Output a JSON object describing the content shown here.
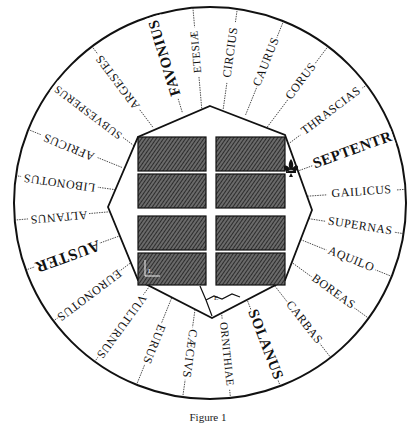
{
  "figure": {
    "caption": "Figure 1",
    "colors": {
      "ink": "#111111",
      "paper": "#ffffff",
      "hatch": "#3a3a3a"
    }
  },
  "center": {
    "x": 210,
    "y": 203,
    "r": 196
  },
  "winds": [
    {
      "label": "FAVONIUS",
      "angle": 107,
      "size": 15,
      "major": true
    },
    {
      "label": "ETESIÆ",
      "angle": 95,
      "size": 11,
      "major": false
    },
    {
      "label": "CIRCIUS",
      "angle": 82,
      "size": 12,
      "major": false
    },
    {
      "label": "CAURUS",
      "angle": 68,
      "size": 12,
      "major": false
    },
    {
      "label": "CORUS",
      "angle": 53,
      "size": 12,
      "major": false
    },
    {
      "label": "THRASCIAS",
      "angle": 37,
      "size": 12,
      "major": false
    },
    {
      "label": "SEPTENTR",
      "angle": 20,
      "size": 15,
      "major": true
    },
    {
      "label": "GAILICUS",
      "angle": 4,
      "size": 12,
      "major": false
    },
    {
      "label": "SUPERNAS",
      "angle": -9,
      "size": 12,
      "major": false
    },
    {
      "label": "AQUILO",
      "angle": -22,
      "size": 12,
      "major": false
    },
    {
      "label": "BOREAS",
      "angle": -36,
      "size": 12,
      "major": false
    },
    {
      "label": "CARBAS",
      "angle": -52,
      "size": 12,
      "major": false
    },
    {
      "label": "SOLANUS",
      "angle": -69,
      "size": 15,
      "major": true
    },
    {
      "label": "ORNITHIAE",
      "angle": -84,
      "size": 11,
      "major": false
    },
    {
      "label": "CÆCIVS",
      "angle": -98,
      "size": 12,
      "major": false
    },
    {
      "label": "EURUS",
      "angle": -112,
      "size": 12,
      "major": false
    },
    {
      "label": "VULTURNUS",
      "angle": -126,
      "size": 12,
      "major": false
    },
    {
      "label": "EURONOTUS",
      "angle": -143,
      "size": 12,
      "major": false
    },
    {
      "label": "AUSTER",
      "angle": -160,
      "size": 16,
      "major": true
    },
    {
      "label": "ALTANUS",
      "angle": -175,
      "size": 12,
      "major": false
    },
    {
      "label": "LIBONOTUS",
      "angle": 172,
      "size": 12,
      "major": false
    },
    {
      "label": "AFRICUS",
      "angle": 158,
      "size": 12,
      "major": false
    },
    {
      "label": "SUBVESPERUS",
      "angle": 143,
      "size": 11,
      "major": false
    },
    {
      "label": "ARGESTES",
      "angle": 127,
      "size": 12,
      "major": false
    }
  ],
  "octagon": [
    [
      210,
      106
    ],
    [
      285,
      135
    ],
    [
      312,
      210
    ],
    [
      285,
      280
    ],
    [
      212,
      318
    ],
    [
      138,
      280
    ],
    [
      108,
      207
    ],
    [
      138,
      137
    ]
  ],
  "blocks": [
    {
      "x": 138,
      "y": 137,
      "w": 68,
      "h": 34
    },
    {
      "x": 216,
      "y": 137,
      "w": 69,
      "h": 34
    },
    {
      "x": 138,
      "y": 174,
      "w": 68,
      "h": 34
    },
    {
      "x": 216,
      "y": 174,
      "w": 69,
      "h": 34
    },
    {
      "x": 138,
      "y": 216,
      "w": 68,
      "h": 34
    },
    {
      "x": 216,
      "y": 216,
      "w": 69,
      "h": 34
    },
    {
      "x": 138,
      "y": 253,
      "w": 68,
      "h": 32
    },
    {
      "x": 216,
      "y": 253,
      "w": 69,
      "h": 32
    }
  ],
  "marks": {
    "gate_letter": "E",
    "corner_letter": "L"
  }
}
